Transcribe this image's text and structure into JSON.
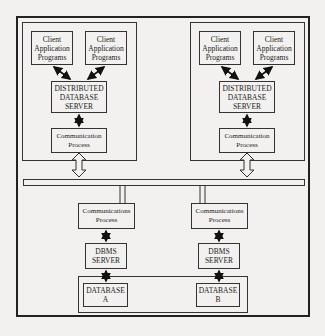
{
  "diagram": {
    "sites": [
      {
        "clients": [
          {
            "line1": "Client",
            "line2": "Application",
            "line3": "Programs"
          },
          {
            "line1": "Client",
            "line2": "Application",
            "line3": "Programs"
          }
        ],
        "server": {
          "line1": "DISTRIBUTED",
          "line2": "DATABASE",
          "line3": "SERVER"
        },
        "comm": {
          "line1": "Communication",
          "line2": "Process"
        }
      },
      {
        "clients": [
          {
            "line1": "Client",
            "line2": "Application",
            "line3": "Programs"
          },
          {
            "line1": "Client",
            "line2": "Application",
            "line3": "Programs"
          }
        ],
        "server": {
          "line1": "DISTRIBUTED",
          "line2": "DATABASE",
          "line3": "SERVER"
        },
        "comm": {
          "line1": "Communication",
          "line2": "Process"
        }
      }
    ],
    "backend": [
      {
        "comm": {
          "line1": "Communications",
          "line2": "Process"
        },
        "dbms": {
          "line1": "DBMS",
          "line2": "SERVER"
        },
        "database": {
          "line1": "DATABASE",
          "line2": "A"
        }
      },
      {
        "comm": {
          "line1": "Communications",
          "line2": "Process"
        },
        "dbms": {
          "line1": "DBMS",
          "line2": "SERVER"
        },
        "database": {
          "line1": "DATABASE",
          "line2": "B"
        }
      }
    ]
  }
}
